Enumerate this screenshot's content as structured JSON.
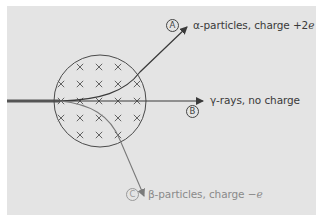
{
  "diagram": {
    "field": {
      "symbol": "×",
      "meaning": "magnetic field into page",
      "rows": [
        [
          80,
          99,
          118
        ],
        [
          61,
          80,
          99,
          118,
          137
        ],
        [
          61,
          80,
          99,
          118,
          137
        ],
        [
          61,
          80,
          99,
          118,
          137
        ],
        [
          80,
          99,
          118
        ]
      ]
    },
    "rays": [
      {
        "tag": "A",
        "label_main": "α-particles, charge +2",
        "label_var": "e",
        "color": "#3a3a3a"
      },
      {
        "tag": "B",
        "label_main": "γ-rays, no charge",
        "label_var": "",
        "color": "#3a3a3a"
      },
      {
        "tag": "C",
        "label_main": "β-particles, charge −",
        "label_var": "e",
        "color": "#8a8a8a"
      }
    ],
    "colors": {
      "panel": "#e4e4e4",
      "dark_line": "#3a3a3a",
      "light_line": "#8a8a8a",
      "cross": "#555555"
    }
  }
}
